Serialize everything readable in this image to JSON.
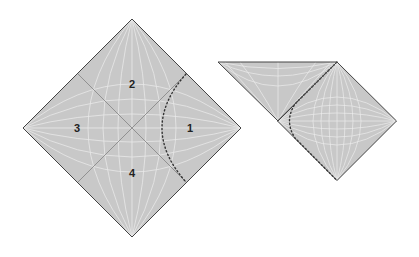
{
  "figure": {
    "type": "penrose-diagrams",
    "colors": {
      "fill": "#c8c8c8",
      "grid": "#ececec",
      "edge": "#444444",
      "horizon": "#8a8a8a",
      "trajectory": "#333333",
      "background": "#ffffff"
    },
    "left_diagram": {
      "shape": "diamond",
      "center": [
        132,
        128
      ],
      "half_diagonal": 109,
      "regions": [
        {
          "id": "region-1",
          "label": "1",
          "pos": [
            190,
            132
          ]
        },
        {
          "id": "region-2",
          "label": "2",
          "pos": [
            132,
            88
          ]
        },
        {
          "id": "region-3",
          "label": "3",
          "pos": [
            77,
            132
          ]
        },
        {
          "id": "region-4",
          "label": "4",
          "pos": [
            132,
            177
          ]
        }
      ],
      "horizons": [
        [
          [
            78,
            74
          ],
          [
            186,
            182
          ]
        ],
        [
          [
            78,
            182
          ],
          [
            186,
            74
          ]
        ]
      ],
      "trajectory": {
        "kind": "dotted-hyperbola",
        "top": [
          186,
          74
        ],
        "vertex": [
          146,
          128
        ],
        "bottom": [
          186,
          182
        ]
      }
    },
    "right_diagram": {
      "triangle": [
        [
          218,
          62
        ],
        [
          337,
          62
        ],
        [
          278,
          121
        ]
      ],
      "diamond": {
        "center": [
          337,
          121
        ],
        "half_diagonal": 59.5
      },
      "trajectory": {
        "kind": "dotted-curve",
        "top": [
          337,
          62
        ],
        "vertex": [
          289,
          121
        ],
        "bottom": [
          337,
          181
        ]
      }
    }
  }
}
